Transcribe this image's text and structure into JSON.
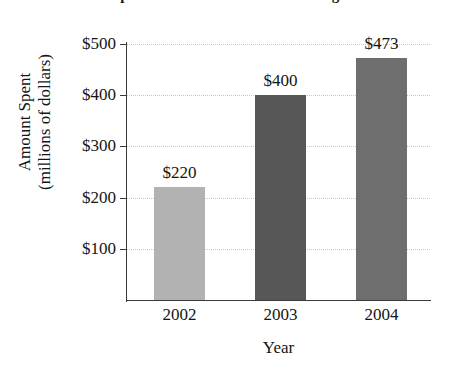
{
  "chart_data": {
    "type": "bar",
    "title": "Spent in the U.S. on Online Dating",
    "categories": [
      "2002",
      "2003",
      "2004"
    ],
    "values": [
      220,
      400,
      473
    ],
    "value_labels": [
      "$220",
      "$400",
      "$473"
    ],
    "series": [
      {
        "name": "Amount Spent",
        "values": [
          220,
          400,
          473
        ]
      }
    ],
    "xlabel": "Year",
    "ylabel_lines": [
      "Amount Spent",
      "(millions of dollars)"
    ],
    "ylabel": "Amount Spent (millions of dollars)",
    "ylim": [
      0,
      500
    ],
    "ytick_values": [
      100,
      200,
      300,
      400,
      500
    ],
    "ytick_labels": [
      "$100",
      "$200",
      "$300",
      "$400",
      "$500"
    ],
    "grid": true,
    "legend": "none",
    "bar_colors": [
      "#b2b2b2",
      "#575757",
      "#6e6e6e"
    ],
    "axis_color": "#3a3a3a",
    "gridline_color": "#c9c9c9"
  }
}
